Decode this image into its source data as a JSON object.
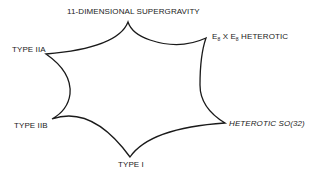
{
  "diagram": {
    "title": "",
    "vertices": [
      {
        "id": "m-theory",
        "label": "11-DIMENSIONAL SUPERGRAVITY"
      },
      {
        "id": "e8e8",
        "label_prefix": "E",
        "sub1": "8",
        "mid": " X E",
        "sub2": "8",
        "label_suffix": " HETEROTIC"
      },
      {
        "id": "iia",
        "label": "TYPE IIA"
      },
      {
        "id": "iib",
        "label": "TYPE IIB"
      },
      {
        "id": "so32",
        "label": "HETEROTIC SO(32)"
      },
      {
        "id": "typei",
        "label": "TYPE I"
      }
    ],
    "edges": [
      [
        "m-theory",
        "e8e8"
      ],
      [
        "e8e8",
        "so32"
      ],
      [
        "so32",
        "typei"
      ],
      [
        "typei",
        "iib"
      ],
      [
        "iib",
        "iia"
      ],
      [
        "iia",
        "m-theory"
      ]
    ],
    "stroke_color": "#1a1a1a"
  }
}
